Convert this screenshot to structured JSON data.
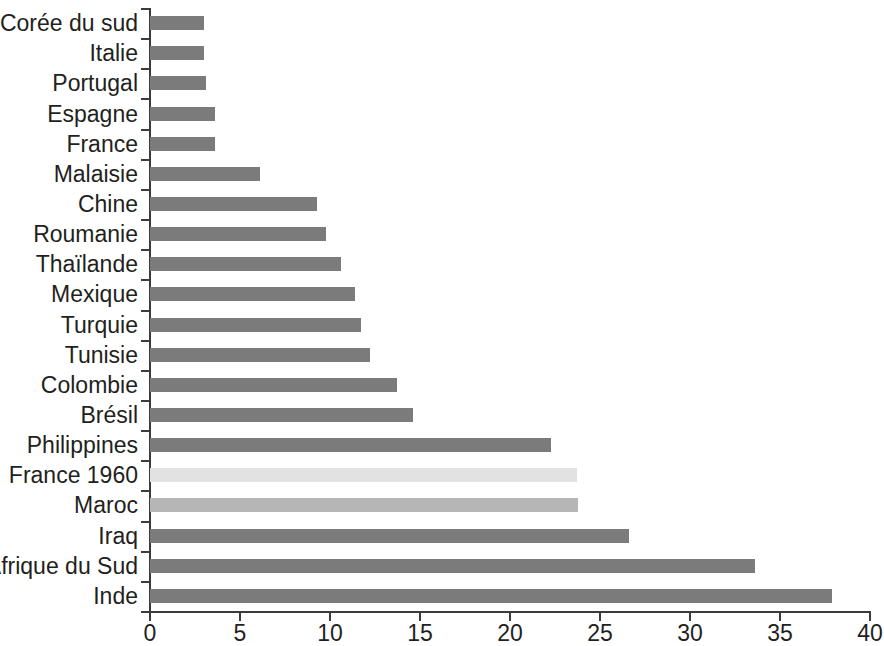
{
  "chart_data": {
    "type": "bar",
    "orientation": "horizontal",
    "title": "",
    "subtitle": "",
    "xlabel": "",
    "ylabel": "",
    "xlim": [
      0,
      40
    ],
    "ylim": null,
    "grid": false,
    "legend": null,
    "x_ticks": [
      "0",
      "5",
      "10",
      "15",
      "20",
      "25",
      "30",
      "35",
      "40"
    ],
    "x_tick_values": [
      0,
      5,
      10,
      15,
      20,
      25,
      30,
      35,
      40
    ],
    "categories": [
      "Corée du sud",
      "Italie",
      "Portugal",
      "Espagne",
      "France",
      "Malaisie",
      "Chine",
      "Roumanie",
      "Thaïlande",
      "Mexique",
      "Turquie",
      "Tunisie",
      "Colombie",
      "Brésil",
      "Philippines",
      "France 1960",
      "Maroc",
      "Iraq",
      "Afrique du Sud",
      "Inde"
    ],
    "values": [
      3.0,
      3.0,
      3.1,
      3.6,
      3.6,
      6.1,
      9.3,
      9.8,
      10.6,
      11.4,
      11.7,
      12.2,
      13.7,
      14.6,
      22.3,
      23.7,
      23.8,
      26.6,
      33.6,
      37.9
    ],
    "bar_styles": [
      "dark",
      "dark",
      "dark",
      "dark",
      "dark",
      "dark",
      "dark",
      "dark",
      "dark",
      "dark",
      "dark",
      "dark",
      "dark",
      "dark",
      "dark",
      "light",
      "mid",
      "dark",
      "dark",
      "dark"
    ],
    "colors": {
      "bar_dark": "#7b7b7b",
      "bar_light": "#e2e2e2",
      "bar_mid": "#b6b6b6",
      "axis": "#3b3b3b",
      "text": "#231f20",
      "background": "#ffffff"
    }
  }
}
